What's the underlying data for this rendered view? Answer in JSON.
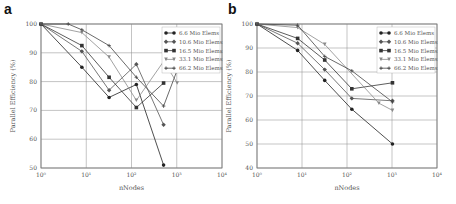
{
  "chart_data": [
    {
      "panel": "a",
      "type": "line",
      "xscale": "log",
      "xlabel": "nNodes",
      "ylabel": "Parallel Efficiency (%)",
      "xlim": [
        1,
        10000
      ],
      "ylim": [
        50,
        100
      ],
      "xticks": [
        "10^0",
        "10^1",
        "10^2",
        "10^3",
        "10^4"
      ],
      "yticks": [
        50,
        60,
        70,
        80,
        90,
        100
      ],
      "grid": true,
      "legend_position": "upper right",
      "series": [
        {
          "name": "6.6 Mio Elems",
          "marker": "circle",
          "x": [
            1,
            8,
            32,
            128,
            512
          ],
          "y": [
            100,
            85,
            74.5,
            79,
            51
          ]
        },
        {
          "name": "10.6 Mio Elems",
          "marker": "diamond",
          "x": [
            1,
            8,
            32,
            128,
            512
          ],
          "y": [
            100,
            90.5,
            77,
            86,
            65
          ]
        },
        {
          "name": "16.5 Mio Elems",
          "marker": "square",
          "x": [
            1,
            8,
            32,
            128,
            512
          ],
          "y": [
            100,
            92.5,
            81.5,
            71,
            79.5
          ]
        },
        {
          "name": "33.1 Mio Elems",
          "marker": "triangle-down",
          "x": [
            1,
            8,
            32,
            128,
            512,
            1024
          ],
          "y": [
            100,
            97,
            88.5,
            73.5,
            87,
            79.5
          ]
        },
        {
          "name": "66.2 Mio Elems",
          "marker": "plus",
          "x": [
            1,
            4,
            8,
            32,
            128,
            512,
            1024
          ],
          "y": [
            100,
            100,
            98,
            92.5,
            81.5,
            71.5,
            84
          ]
        }
      ]
    },
    {
      "panel": "b",
      "type": "line",
      "xscale": "log",
      "xlabel": "nNodes",
      "ylabel": "Parallel Efficiency (%)",
      "xlim": [
        1,
        10000
      ],
      "ylim": [
        40,
        100
      ],
      "xticks": [
        "10^0",
        "10^1",
        "10^2",
        "10^3",
        "10^4"
      ],
      "yticks": [
        40,
        50,
        60,
        70,
        80,
        90,
        100
      ],
      "grid": true,
      "legend_position": "upper right",
      "series": [
        {
          "name": "6.6 Mio Elems",
          "marker": "circle",
          "x": [
            1,
            8,
            32,
            128,
            1024
          ],
          "y": [
            100,
            89,
            76.5,
            64.5,
            50
          ]
        },
        {
          "name": "10.6 Mio Elems",
          "marker": "diamond",
          "x": [
            1,
            8,
            32,
            128,
            1024
          ],
          "y": [
            100,
            92,
            81,
            69,
            68
          ]
        },
        {
          "name": "16.5 Mio Elems",
          "marker": "square",
          "x": [
            1,
            8,
            32,
            128,
            1024
          ],
          "y": [
            100,
            94,
            85,
            73,
            75.5
          ]
        },
        {
          "name": "33.1 Mio Elems",
          "marker": "triangle-down",
          "x": [
            1,
            8,
            32,
            512,
            1024
          ],
          "y": [
            100,
            98.5,
            91.5,
            67,
            64
          ]
        },
        {
          "name": "66.2 Mio Elems",
          "marker": "plus",
          "x": [
            1,
            8,
            32,
            128,
            1024
          ],
          "y": [
            100,
            99.5,
            86.5,
            80.5,
            67.5
          ]
        }
      ]
    }
  ],
  "labels": {
    "panel_a": "a",
    "panel_b": "b",
    "xlabel": "nNodes",
    "ylabel": "Parallel Efficiency (%)"
  }
}
